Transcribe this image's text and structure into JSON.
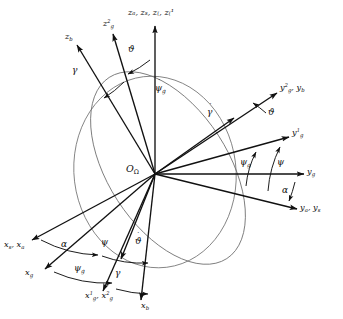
{
  "figure": {
    "kind": "vector-axes-diagram",
    "origin_label": "O",
    "origin_sub": "Ω",
    "stroke_color": "#111111",
    "circle_color": "#6b6b6b",
    "background": "#ffffff"
  },
  "axes": [
    {
      "id": "z-top",
      "label": "z",
      "sub": "a",
      "extra": ", z",
      "text": "zₐ, zₛ, z₍, z₍¹"
    },
    {
      "id": "z-g2",
      "label": "z",
      "sup": "2",
      "sub": "g"
    },
    {
      "id": "z-b",
      "label": "z",
      "sub": "b"
    },
    {
      "id": "y-g2-yb",
      "label": "y",
      "sup": "2",
      "sub": "g"
    },
    {
      "id": "y-g1",
      "label": "y",
      "sup": "1",
      "sub": "g"
    },
    {
      "id": "y-g",
      "label": "y",
      "sub": "g"
    },
    {
      "id": "y-a-ys",
      "label": "y",
      "sub": "a"
    },
    {
      "id": "x-s-xa",
      "label": "x",
      "sub": "s"
    },
    {
      "id": "x-g",
      "label": "x",
      "sub": "g"
    },
    {
      "id": "x-g1-xg2",
      "label": "x",
      "sup": "1",
      "sub": "g"
    },
    {
      "id": "x-b",
      "label": "x",
      "sub": "b"
    }
  ],
  "labels": {
    "z_top": {
      "text": "zₐ, zₛ, z₍, z₍¹",
      "parts": [
        "z_a",
        "z_s",
        "z_g",
        "z_g^1"
      ]
    },
    "z_g2": {
      "base": "z",
      "sup": "2",
      "sub": "g"
    },
    "z_b": {
      "base": "z",
      "sub": "b"
    },
    "y_g2_y_b": {
      "base1": "y",
      "sup1": "2",
      "sub1": "g",
      "base2": "y",
      "sub2": "b"
    },
    "y_g1": {
      "base": "y",
      "sup": "1",
      "sub": "g"
    },
    "y_g": {
      "base": "y",
      "sub": "g"
    },
    "y_a_y_s": {
      "base1": "y",
      "sub1": "a",
      "base2": "y",
      "sub2": "s"
    },
    "x_s_x_a": {
      "base1": "x",
      "sub1": "s",
      "base2": "x",
      "sub2": "a"
    },
    "x_g": {
      "base": "x",
      "sub": "g"
    },
    "x_g1_x_g2": {
      "base1": "x",
      "sup1": "1",
      "sub1": "g",
      "base2": "x",
      "sup2": "2",
      "sub2": "g"
    },
    "x_b": {
      "base": "x",
      "sub": "b"
    },
    "origin": {
      "base": "O",
      "sub": "Ω"
    }
  },
  "angles": [
    {
      "id": "theta-top",
      "symbol": "ϑ",
      "dot": false,
      "name": "pitch-angle-theta-top"
    },
    {
      "id": "gamma-left",
      "symbol": "γ",
      "dot": false,
      "name": "roll-angle-gamma-upper-left"
    },
    {
      "id": "psi-g-dot",
      "symbol": "ψ",
      "dot": true,
      "sub": "g",
      "name": "psi-g-dot-rate"
    },
    {
      "id": "gamma-dot",
      "symbol": "γ",
      "dot": true,
      "name": "gamma-dot-rate"
    },
    {
      "id": "theta-right",
      "symbol": "ϑ",
      "dot": false,
      "name": "pitch-angle-theta-right"
    },
    {
      "id": "psi-g-right",
      "symbol": "ψ",
      "dot": false,
      "sub": "g",
      "name": "yaw-angle-psi-g-right"
    },
    {
      "id": "psi-right",
      "symbol": "ψ",
      "dot": false,
      "name": "yaw-angle-psi-right"
    },
    {
      "id": "alpha-right",
      "symbol": "α",
      "dot": false,
      "name": "angle-of-attack-alpha-right"
    },
    {
      "id": "alpha-left",
      "symbol": "α",
      "dot": false,
      "name": "angle-of-attack-alpha-left"
    },
    {
      "id": "psi-left",
      "symbol": "ψ",
      "dot": false,
      "name": "yaw-angle-psi-left"
    },
    {
      "id": "psi-g-left",
      "symbol": "ψ",
      "dot": false,
      "sub": "g",
      "name": "yaw-angle-psi-g-left"
    },
    {
      "id": "theta-dot",
      "symbol": "ϑ",
      "dot": true,
      "name": "theta-dot-rate"
    },
    {
      "id": "gamma-bottom",
      "symbol": "γ",
      "dot": false,
      "name": "roll-angle-gamma-bottom"
    }
  ],
  "geometry": {
    "origin": {
      "x": 155,
      "y": 174
    },
    "rays": [
      {
        "name": "z-top",
        "x2": 155,
        "y2": 26
      },
      {
        "name": "z-g2",
        "x2": 112,
        "y2": 33
      },
      {
        "name": "z-b",
        "x2": 76,
        "y2": 44
      },
      {
        "name": "y-g2-yb",
        "x2": 278,
        "y2": 92
      },
      {
        "name": "y-g1",
        "x2": 290,
        "y2": 136
      },
      {
        "name": "y-g",
        "x2": 305,
        "y2": 174
      },
      {
        "name": "y-a-ys",
        "x2": 298,
        "y2": 209
      },
      {
        "name": "gamma-dot",
        "x2": 232,
        "y2": 117
      },
      {
        "name": "x-s-xa",
        "x2": 31,
        "y2": 239
      },
      {
        "name": "x-g",
        "x2": 44,
        "y2": 268
      },
      {
        "name": "x-g1-xg2",
        "x2": 102,
        "y2": 290
      },
      {
        "name": "x-b",
        "x2": 140,
        "y2": 299
      },
      {
        "name": "theta-dot",
        "x2": 120,
        "y2": 258
      }
    ],
    "ellipse_vertical": {
      "cx": 155,
      "cy": 174,
      "rx": 82,
      "ry": 96,
      "rot": -8
    },
    "ellipse_tilted": {
      "cx": 171,
      "cy": 166,
      "rx": 112,
      "ry": 86,
      "rot": 62
    }
  }
}
